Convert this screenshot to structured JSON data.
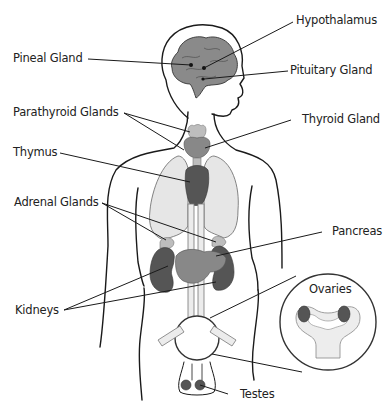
{
  "labels": {
    "hypothalamus": "Hypothalamus",
    "pineal_gland": "Pineal Gland",
    "pituitary_gland": "Pituitary Gland",
    "parathyroid_glands": "Parathyroid Glands",
    "thyroid_gland": "Thyroid Gland",
    "thymus": "Thymus",
    "adrenal_glands": "Adrenal Glands",
    "pancreas": "Pancreas",
    "kidneys": "Kidneys",
    "ovaries": "Ovaries",
    "testes": "Testes"
  },
  "colors": {
    "outline": "#1a1a1a",
    "organ_dark": "#555555",
    "organ_mid": "#888888",
    "organ_light": "#bdbdbd",
    "lung": "#e6e6e6",
    "background": "#ffffff"
  }
}
